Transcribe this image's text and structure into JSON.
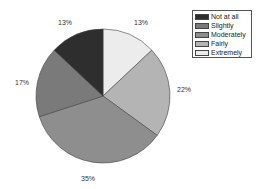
{
  "chart_data": {
    "type": "pie",
    "title": "",
    "categories": [
      "Not at all",
      "Slightly",
      "Moderately",
      "Fairly",
      "Extremely"
    ],
    "values": [
      13,
      17,
      35,
      22,
      13
    ],
    "labels": [
      "13%",
      "17%",
      "35%",
      "22%",
      "13%"
    ],
    "colors": [
      "#2e2e2e",
      "#7a7a7a",
      "#8e8e8e",
      "#b4b4b4",
      "#ececec"
    ],
    "start_angle_deg": 0,
    "direction": "clockwise",
    "slice_order_from_top": [
      "Extremely",
      "Fairly",
      "Moderately",
      "Slightly",
      "Not at all"
    ],
    "legend_position": "upper right"
  },
  "legend": {
    "items": [
      {
        "label": "Not at all",
        "color": "#2e2e2e"
      },
      {
        "label": "Slightly",
        "color": "#7a7a7a"
      },
      {
        "label": "Moderately",
        "color": "#8e8e8e"
      },
      {
        "label": "Fairly",
        "color": "#b4b4b4"
      },
      {
        "label": "Extremely",
        "color": "#ececec"
      }
    ]
  },
  "slice_labels": {
    "extremely": "13%",
    "fairly": "22%",
    "moderately": "35%",
    "slightly": "17%",
    "not_at_all": "13%"
  }
}
